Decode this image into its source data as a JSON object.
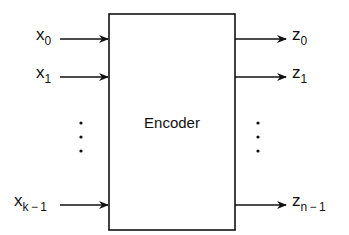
{
  "diagram": {
    "block": {
      "label": "Encoder"
    },
    "inputs": [
      {
        "base": "x",
        "sub": "0"
      },
      {
        "base": "x",
        "sub": "1"
      },
      {
        "base": "x",
        "sub": "k − 1"
      }
    ],
    "outputs": [
      {
        "base": "z",
        "sub": "0"
      },
      {
        "base": "z",
        "sub": "1"
      },
      {
        "base": "z",
        "sub": "n − 1"
      }
    ],
    "ellipsis": "⋮",
    "colors": {
      "stroke": "#111111",
      "background": "#ffffff"
    }
  }
}
